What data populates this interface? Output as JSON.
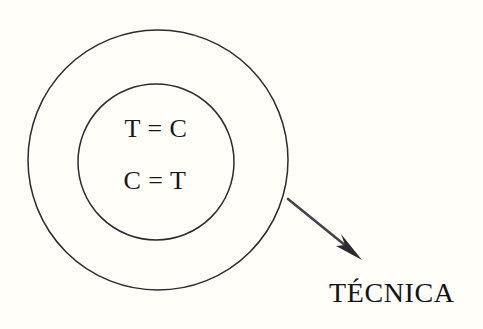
{
  "figure": {
    "background_color": "#fffef8",
    "stroke_color": "#2b2a2e",
    "text_color": "#18161a",
    "outer_circle": {
      "name": "outer-circle",
      "cx": 158,
      "cy": 160,
      "r": 130
    },
    "inner_circle": {
      "name": "inner-circle",
      "cx": 156,
      "cy": 162,
      "r": 78
    },
    "equations": [
      {
        "id": "line1",
        "text": "T = C"
      },
      {
        "id": "line2",
        "text": "C = T"
      }
    ],
    "arrow": {
      "name": "pointer-arrow",
      "from_x": 288,
      "from_y": 199,
      "to_x": 360,
      "to_y": 258,
      "color": "#35333a"
    },
    "label": {
      "text": "TÉCNICA"
    }
  }
}
